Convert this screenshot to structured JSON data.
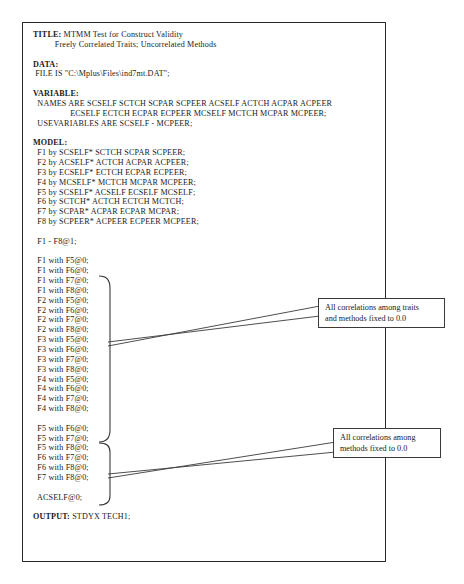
{
  "document": {
    "kind": "mplus-input-listing",
    "frame_border_color": "#2a2a2a",
    "callout_border_color": "#3a3a3a",
    "leader_color": "#3a3a3a"
  },
  "code": {
    "lines": [
      {
        "bold": "TITLE:",
        "text": " MTMM Test for Construct Validity"
      },
      {
        "bold": "",
        "text": "          Freely Correlated Traits; Uncorrelated Methods"
      },
      {
        "bold": "",
        "text": ""
      },
      {
        "bold": "DATA:",
        "text": ""
      },
      {
        "bold": "",
        "text": " FILE IS \"C:\\Mplus\\Files\\ind7mt.DAT\";"
      },
      {
        "bold": "",
        "text": ""
      },
      {
        "bold": "VARIABLE:",
        "text": ""
      },
      {
        "bold": "",
        "text": "  NAMES ARE SCSELF SCTCH SCPAR SCPEER ACSELF ACTCH ACPAR ACPEER"
      },
      {
        "bold": "",
        "text": "                 ECSELF ECTCH ECPAR ECPEER MCSELF MCTCH MCPAR MCPEER;"
      },
      {
        "bold": "",
        "text": "  USEVARIABLES ARE SCSELF - MCPEER;"
      },
      {
        "bold": "",
        "text": ""
      },
      {
        "bold": "MODEL:",
        "text": ""
      },
      {
        "bold": "",
        "text": "  F1 by SCSELF* SCTCH SCPAR SCPEER;"
      },
      {
        "bold": "",
        "text": "  F2 by ACSELF* ACTCH ACPAR ACPEER;"
      },
      {
        "bold": "",
        "text": "  F3 by ECSELF* ECTCH ECPAR ECPEER;"
      },
      {
        "bold": "",
        "text": "  F4 by MCSELF* MCTCH MCPAR MCPEER;"
      },
      {
        "bold": "",
        "text": "  F5 by SCSELF* ACSELF ECSELF MCSELF;"
      },
      {
        "bold": "",
        "text": "  F6 by SCTCH* ACTCH ECTCH MCTCH;"
      },
      {
        "bold": "",
        "text": "  F7 by SCPAR* ACPAR ECPAR MCPAR;"
      },
      {
        "bold": "",
        "text": "  F8 by SCPEER* ACPEER ECPEER MCPEER;"
      },
      {
        "bold": "",
        "text": ""
      },
      {
        "bold": "",
        "text": "  F1 - F8@1;"
      },
      {
        "bold": "",
        "text": ""
      },
      {
        "bold": "",
        "text": "  F1 with F5@0;"
      },
      {
        "bold": "",
        "text": "  F1 with F6@0;"
      },
      {
        "bold": "",
        "text": "  F1 with F7@0;"
      },
      {
        "bold": "",
        "text": "  F1 with F8@0;"
      },
      {
        "bold": "",
        "text": "  F2 with F5@0;"
      },
      {
        "bold": "",
        "text": "  F2 with F6@0;"
      },
      {
        "bold": "",
        "text": "  F2 with F7@0;"
      },
      {
        "bold": "",
        "text": "  F2 with F8@0;"
      },
      {
        "bold": "",
        "text": "  F3 with F5@0;"
      },
      {
        "bold": "",
        "text": "  F3 with F6@0;"
      },
      {
        "bold": "",
        "text": "  F3 with F7@0;"
      },
      {
        "bold": "",
        "text": "  F3 with F8@0;"
      },
      {
        "bold": "",
        "text": "  F4 with F5@0;"
      },
      {
        "bold": "",
        "text": "  F4 with F6@0;"
      },
      {
        "bold": "",
        "text": "  F4 with F7@0;"
      },
      {
        "bold": "",
        "text": "  F4 with F8@0;"
      },
      {
        "bold": "",
        "text": ""
      },
      {
        "bold": "",
        "text": "  F5 with F6@0;"
      },
      {
        "bold": "",
        "text": "  F5 with F7@0;"
      },
      {
        "bold": "",
        "text": "  F5 with F8@0;"
      },
      {
        "bold": "",
        "text": "  F6 with F7@0;"
      },
      {
        "bold": "",
        "text": "  F6 with F8@0;"
      },
      {
        "bold": "",
        "text": "  F7 with F8@0;"
      },
      {
        "bold": "",
        "text": ""
      },
      {
        "bold": "",
        "text": "  ACSELF@0;"
      },
      {
        "bold": "",
        "text": ""
      },
      {
        "bold": "OUTPUT:",
        "text": " STDYX TECH1;"
      }
    ]
  },
  "annotations": {
    "traits_methods": {
      "line1": "All correlations among traits",
      "line2": "and methods fixed to 0.0"
    },
    "methods_only": {
      "line1": "All correlations among",
      "line2": "methods fixed to 0.0"
    }
  }
}
